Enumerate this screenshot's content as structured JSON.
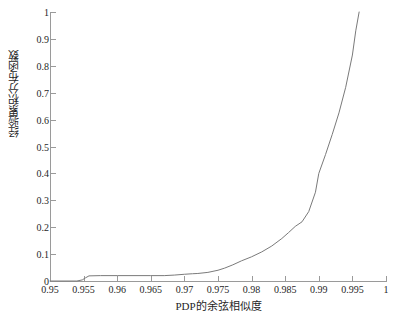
{
  "chart_data": {
    "type": "line",
    "title": "",
    "xlabel": "PDP的余弦相似度",
    "ylabel": "经验累积分布函数",
    "xlim": [
      0.95,
      1
    ],
    "ylim": [
      0,
      1
    ],
    "grid": false,
    "legend": null,
    "line_color": "#7a7a7a",
    "xticks": [
      0.95,
      0.955,
      0.96,
      0.965,
      0.97,
      0.975,
      0.98,
      0.985,
      0.99,
      0.995,
      1
    ],
    "xticklabels": [
      "0.95",
      "0.955",
      "0.96",
      "0.965",
      "0.97",
      "0.975",
      "0.98",
      "0.985",
      "0.99",
      "0.995",
      "1"
    ],
    "yticks": [
      0,
      0.1,
      0.2,
      0.3,
      0.4,
      0.5,
      0.6,
      0.7,
      0.8,
      0.9,
      1
    ],
    "yticklabels": [
      "0",
      "0.1",
      "0.2",
      "0.3",
      "0.4",
      "0.5",
      "0.6",
      "0.7",
      "0.8",
      "0.9",
      "1"
    ],
    "series": [
      {
        "name": "empirical CDF",
        "x": [
          0.95,
          0.954,
          0.9548,
          0.9553,
          0.9558,
          0.9575,
          0.96,
          0.9625,
          0.965,
          0.967,
          0.9685,
          0.97,
          0.9712,
          0.972,
          0.9735,
          0.975,
          0.976,
          0.9772,
          0.9785,
          0.98,
          0.9815,
          0.983,
          0.9845,
          0.9855,
          0.9865,
          0.9875,
          0.9885,
          0.9895,
          0.99,
          0.991,
          0.992,
          0.993,
          0.994,
          0.995,
          0.9955,
          0.996
        ],
        "y": [
          0.0,
          0.0,
          0.004,
          0.012,
          0.019,
          0.02,
          0.02,
          0.02,
          0.02,
          0.02,
          0.022,
          0.025,
          0.027,
          0.028,
          0.032,
          0.04,
          0.048,
          0.06,
          0.075,
          0.09,
          0.108,
          0.13,
          0.158,
          0.18,
          0.203,
          0.22,
          0.258,
          0.33,
          0.4,
          0.47,
          0.545,
          0.625,
          0.72,
          0.84,
          0.93,
          1.0
        ]
      }
    ]
  }
}
